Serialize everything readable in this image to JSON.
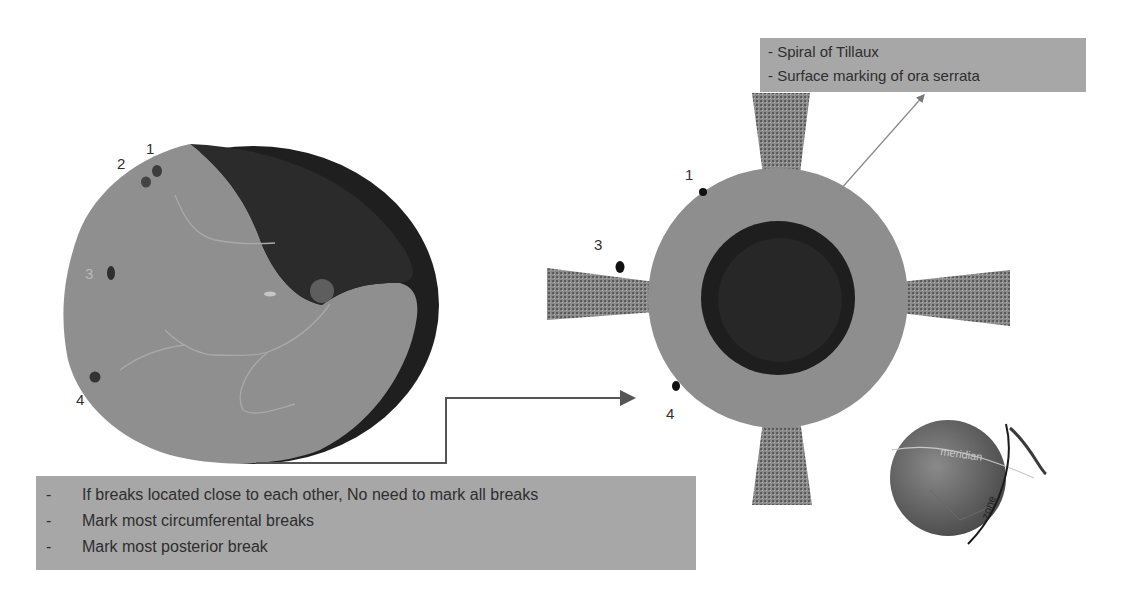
{
  "callout_top": {
    "lines": [
      "- Spiral of Tillaux",
      "- Surface marking of ora serrata"
    ]
  },
  "callout_bottom": {
    "items": [
      {
        "dash": "-",
        "text": "If breaks located close to each other, No need to mark all breaks"
      },
      {
        "dash": "-",
        "text": "Mark most circumferental breaks"
      },
      {
        "dash": "-",
        "text": "Mark most posterior break"
      }
    ]
  },
  "fundus_drawing": {
    "break_labels": [
      "1",
      "2",
      "3",
      "4"
    ]
  },
  "schematic_drawing": {
    "break_labels": [
      "1",
      "3",
      "4"
    ]
  },
  "globe_drawing": {
    "labels": [
      "meridian",
      "zone"
    ]
  },
  "colors": {
    "retina_gray": "#8f8f8f",
    "detached_dark": "#2a2a2a",
    "box_gray": "#a7a7a7",
    "break_dot": "#3a3a3a",
    "muscle_texture": "#7d7d7d"
  }
}
